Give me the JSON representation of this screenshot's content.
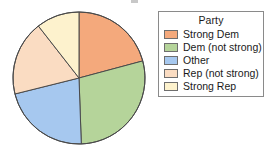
{
  "chart_data": {
    "type": "pie",
    "title": "",
    "legend_title": "Party",
    "legend_position": "right",
    "start_angle_deg": 0,
    "direction": "clockwise",
    "categories": [
      "Strong Dem",
      "Dem (not strong)",
      "Other",
      "Rep (not strong)",
      "Strong Rep"
    ],
    "values": [
      20.8,
      28.6,
      21.7,
      18.3,
      10.6
    ],
    "unit": "percent",
    "slice_angles_deg": [
      75,
      103,
      78,
      66,
      38
    ],
    "slice_boundaries_deg": [
      0,
      75,
      178,
      256,
      322,
      360
    ],
    "colors": [
      "#f4a97c",
      "#b5d49a",
      "#a6c8ef",
      "#fadcc2",
      "#fdf2cd"
    ],
    "edge_color": "#4a4a4a",
    "grid": false
  },
  "pie": {
    "center_x": 79,
    "center_y": 78,
    "radius": 66,
    "slices": [
      {
        "label": "Strong Dem",
        "color": "#f4a97c",
        "start": 0,
        "end": 75
      },
      {
        "label": "Dem (not strong)",
        "color": "#b5d49a",
        "start": 75,
        "end": 178
      },
      {
        "label": "Other",
        "color": "#a6c8ef",
        "start": 178,
        "end": 256
      },
      {
        "label": "Rep (not strong)",
        "color": "#fadcc2",
        "start": 256,
        "end": 322
      },
      {
        "label": "Strong Rep",
        "color": "#fdf2cd",
        "start": 322,
        "end": 360
      }
    ]
  },
  "legend": {
    "title": "Party",
    "items": [
      {
        "label": "Strong Dem",
        "color": "#f4a97c"
      },
      {
        "label": "Dem (not strong)",
        "color": "#b5d49a"
      },
      {
        "label": "Other",
        "color": "#a6c8ef"
      },
      {
        "label": "Rep (not strong)",
        "color": "#fadcc2"
      },
      {
        "label": "Strong Rep",
        "color": "#fdf2cd"
      }
    ]
  }
}
